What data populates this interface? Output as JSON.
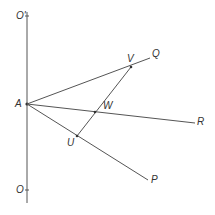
{
  "diagram": {
    "type": "geometry",
    "colors": {
      "line": "#555555",
      "label": "#333333",
      "background": "#ffffff"
    },
    "points": {
      "O_prime": {
        "label": "O'",
        "x": 27,
        "y": 16
      },
      "A": {
        "label": "A",
        "x": 27,
        "y": 104
      },
      "O": {
        "label": "O",
        "x": 27,
        "y": 190
      },
      "V": {
        "label": "V",
        "x": 131,
        "y": 67
      },
      "Q": {
        "label": "Q",
        "x": 150,
        "y": 58
      },
      "W": {
        "label": "W",
        "x": 95,
        "y": 112
      },
      "R": {
        "label": "R",
        "x": 195,
        "y": 123
      },
      "U": {
        "label": "U",
        "x": 77,
        "y": 136
      },
      "P": {
        "label": "P",
        "x": 148,
        "y": 180
      }
    },
    "segments": [
      {
        "from": "O_prime",
        "to": "O",
        "name": "vertical-axis"
      },
      {
        "from": "A",
        "to": "Q",
        "name": "ray-AQ"
      },
      {
        "from": "A",
        "to": "R",
        "name": "ray-AR"
      },
      {
        "from": "A",
        "to": "P",
        "name": "ray-AP"
      },
      {
        "from": "U",
        "to": "V",
        "name": "transversal-UV"
      }
    ],
    "labels": {
      "o_prime": "O'",
      "a": "A",
      "o": "O",
      "v": "V",
      "q": "Q",
      "w": "W",
      "r": "R",
      "u": "U",
      "p": "P"
    }
  }
}
